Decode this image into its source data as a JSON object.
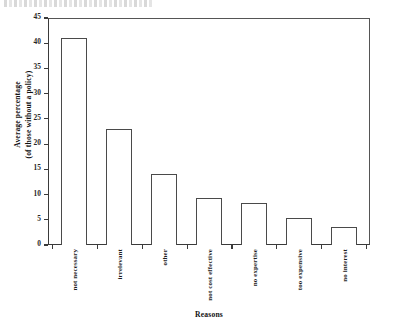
{
  "chart_data": {
    "type": "bar",
    "title": "",
    "categories": [
      "not necessary",
      "irrelevant",
      "other",
      "not cost effective",
      "no expertise",
      "too expensive",
      "no interest"
    ],
    "values": [
      41,
      23,
      14,
      9.3,
      8.3,
      5.3,
      3.5
    ],
    "xlabel": "Reasons",
    "ylabel": "Average percentage (of those without a policy)",
    "ylabel_line1": "Average percentage",
    "ylabel_line2": "(of those without a policy)",
    "ylim": [
      0,
      45
    ],
    "yticks": [
      0,
      5,
      10,
      15,
      20,
      25,
      30,
      35,
      40,
      45
    ],
    "ytick_labels": [
      "0",
      "5",
      "10",
      "15",
      "20",
      "25",
      "30",
      "35",
      "40",
      "45"
    ],
    "grid": false,
    "legend": null,
    "bar_fill": "#ffffff",
    "bar_edge": "#4a4a4a",
    "axis_color": "#3a3a3a"
  }
}
